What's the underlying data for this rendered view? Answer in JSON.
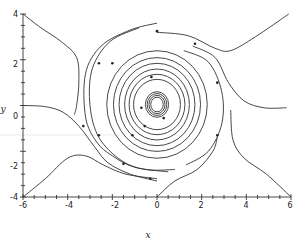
{
  "chart_data": {
    "type": "line",
    "subtype": "phase_portrait",
    "title": "",
    "xlabel": "x",
    "ylabel": "y",
    "xlim": [
      -6,
      6
    ],
    "ylim": [
      -4,
      4
    ],
    "x_ticks": [
      -6,
      -4,
      -2,
      0,
      2,
      4,
      6
    ],
    "x_tick_labels": [
      "-6",
      "-4",
      "-2",
      "0",
      "2",
      "4",
      "6"
    ],
    "y_ticks": [
      -4,
      -2,
      0,
      2,
      4
    ],
    "y_tick_labels": [
      "-4",
      "-2",
      "0",
      "2",
      "4"
    ],
    "minor_tick_step": 0.5,
    "grid": false,
    "legend": null,
    "faint_reference_line_y": -1.3,
    "equilibrium": {
      "x": 0,
      "y": 0,
      "type": "center"
    },
    "closed_orbits": [
      {
        "rx": 0.28,
        "ry": 0.32
      },
      {
        "rx": 0.36,
        "ry": 0.4
      },
      {
        "rx": 0.44,
        "ry": 0.48
      },
      {
        "rx": 0.52,
        "ry": 0.56
      },
      {
        "rx": 1.05,
        "ry": 1.1
      },
      {
        "rx": 1.25,
        "ry": 1.32
      },
      {
        "rx": 1.45,
        "ry": 1.55
      },
      {
        "rx": 1.7,
        "ry": 1.8
      },
      {
        "rx": 1.95,
        "ry": 2.05
      },
      {
        "rx": 2.25,
        "ry": 2.35
      }
    ],
    "orbit_markers": [
      {
        "x": -0.25,
        "y": 1.25
      },
      {
        "x": 0.3,
        "y": -0.55
      },
      {
        "x": -0.55,
        "y": -0.9
      },
      {
        "x": -1.1,
        "y": -1.3
      }
    ],
    "trajectories": [
      {
        "name": "upper-left-separatrix",
        "points": [
          [
            -6,
            4
          ],
          [
            -5.2,
            3.4
          ],
          [
            -4.3,
            2.8
          ],
          [
            -3.6,
            2.1
          ],
          [
            -3.5,
            1.0
          ],
          [
            -3.6,
            0
          ],
          [
            -3.7,
            -0.4
          ]
        ]
      },
      {
        "name": "left-separatrix",
        "points": [
          [
            -6,
            0
          ],
          [
            -5.0,
            -0.05
          ],
          [
            -4.2,
            -0.3
          ],
          [
            -3.5,
            -0.9
          ],
          [
            -2.8,
            -1.8
          ],
          [
            -2.2,
            -2.5
          ],
          [
            -1.2,
            -3.0
          ],
          [
            0,
            -3.3
          ]
        ]
      },
      {
        "name": "lower-left-separatrix",
        "points": [
          [
            -6,
            -4
          ],
          [
            -5.0,
            -3.2
          ],
          [
            -4.0,
            -2.3
          ],
          [
            -3.2,
            -2.2
          ],
          [
            -2.4,
            -2.6
          ],
          [
            -1.4,
            -3.0
          ],
          [
            0,
            -3.2
          ]
        ]
      },
      {
        "name": "outer-left-orbit-1",
        "points": [
          [
            0,
            3.6
          ],
          [
            -1.2,
            3.3
          ],
          [
            -2.5,
            2.6
          ],
          [
            -3.2,
            1.4
          ],
          [
            -3.2,
            -0.5
          ],
          [
            -2.7,
            -1.6
          ],
          [
            -2.0,
            -2.2
          ],
          [
            -1.0,
            -2.7
          ],
          [
            0.5,
            -2.9
          ]
        ]
      },
      {
        "name": "outer-left-orbit-2",
        "points": [
          [
            -0.8,
            3.4
          ],
          [
            -2.1,
            2.8
          ],
          [
            -2.9,
            1.6
          ],
          [
            -3.0,
            0
          ],
          [
            -2.6,
            -1.4
          ],
          [
            -1.6,
            -2.4
          ],
          [
            -0.5,
            -2.8
          ],
          [
            0.8,
            -2.8
          ]
        ]
      },
      {
        "name": "upper-right-separatrix",
        "points": [
          [
            0,
            3.2
          ],
          [
            1.4,
            3.05
          ],
          [
            2.6,
            2.5
          ],
          [
            3.3,
            2.4
          ],
          [
            4.4,
            3.0
          ],
          [
            5.9,
            4.0
          ]
        ]
      },
      {
        "name": "right-separatrix",
        "points": [
          [
            1.6,
            2.6
          ],
          [
            2.6,
            2.1
          ],
          [
            3.2,
            1.0
          ],
          [
            3.9,
            0.2
          ],
          [
            4.8,
            -0.1
          ],
          [
            5.8,
            -0.1
          ]
        ]
      },
      {
        "name": "lower-right-separatrix",
        "points": [
          [
            3.3,
            -0.2
          ],
          [
            3.4,
            -1.5
          ],
          [
            3.9,
            -2.3
          ],
          [
            4.9,
            -3.0
          ],
          [
            6,
            -4
          ]
        ]
      },
      {
        "name": "lower-right-inflow",
        "points": [
          [
            0,
            -4
          ],
          [
            0.8,
            -3.3
          ],
          [
            1.8,
            -2.8
          ],
          [
            2.5,
            -2.0
          ],
          [
            2.7,
            -1.4
          ]
        ]
      },
      {
        "name": "inner-right-orbit",
        "points": [
          [
            1.2,
            2.4
          ],
          [
            2.3,
            1.9
          ],
          [
            2.9,
            0.6
          ],
          [
            2.9,
            -0.8
          ],
          [
            2.3,
            -2.0
          ],
          [
            1.3,
            -2.6
          ]
        ]
      }
    ],
    "trajectory_markers": [
      {
        "x": -2.6,
        "y": 1.85
      },
      {
        "x": -2.0,
        "y": 1.85
      },
      {
        "x": 0,
        "y": 3.25
      },
      {
        "x": 1.7,
        "y": 2.7
      },
      {
        "x": 2.7,
        "y": 1.0
      },
      {
        "x": 2.7,
        "y": -1.3
      },
      {
        "x": -1.5,
        "y": -2.55
      },
      {
        "x": -3.3,
        "y": -0.9
      },
      {
        "x": -2.6,
        "y": -1.3
      },
      {
        "x": -0.3,
        "y": -3.2
      },
      {
        "x": -0.7,
        "y": -0.1
      }
    ]
  },
  "labels": {
    "xlabel": "x",
    "ylabel": "y",
    "x_ticks": [
      "-6",
      "-4",
      "-2",
      "0",
      "2",
      "4",
      "6"
    ],
    "y_ticks": [
      "4",
      "2",
      "0",
      "-2",
      "-4"
    ]
  }
}
